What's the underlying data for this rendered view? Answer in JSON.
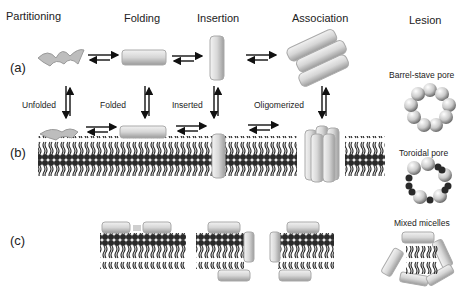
{
  "headers": {
    "partitioning": "Partitioning",
    "folding": "Folding",
    "insertion": "Insertion",
    "association": "Association",
    "lesion": "Lesion"
  },
  "rows": {
    "a": "(a)",
    "b": "(b)",
    "c": "(c)"
  },
  "transitions": {
    "unfolded": "Unfolded",
    "folded": "Folded",
    "inserted": "Inserted",
    "oligomerized": "Oligomerized"
  },
  "lesions": {
    "barrel_stave": "Barrel-stave pore",
    "toroidal": "Toroidal pore",
    "mixed_micelles": "Mixed micelles"
  },
  "colors": {
    "lipid_head": "#2a2a2a",
    "peptide_gray": "#cfcfcf",
    "arrow": "#111111"
  }
}
